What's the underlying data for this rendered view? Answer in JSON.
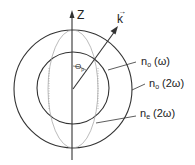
{
  "diagram": {
    "type": "index-ellipsoid phase-matching diagram",
    "axis": {
      "label": "Z"
    },
    "wavevector": {
      "label": "k",
      "arrow": "→"
    },
    "angle": {
      "symbol": "Θ",
      "subscript": "p"
    },
    "curves": [
      {
        "id": "inner-circle",
        "symbol": "n",
        "subscript": "o",
        "arg": "(ω)"
      },
      {
        "id": "outer-circle",
        "symbol": "n",
        "subscript": "o",
        "arg": "(2ω)"
      },
      {
        "id": "ellipse",
        "symbol": "n",
        "subscript": "e",
        "arg": "(2ω)"
      }
    ],
    "colors": {
      "line": "#333333",
      "ellipse": "#aaaaaa",
      "text": "#222222"
    }
  }
}
